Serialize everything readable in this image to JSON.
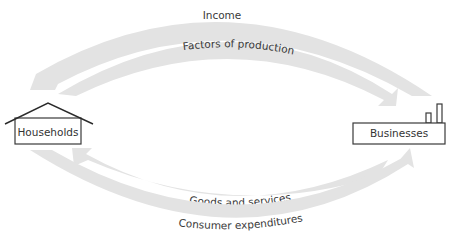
{
  "diagram": {
    "type": "circular-flow",
    "nodes": {
      "households": {
        "label": "Households"
      },
      "businesses": {
        "label": "Businesses"
      }
    },
    "flows": [
      {
        "id": "income",
        "label": "Income",
        "from": "businesses",
        "to": "households",
        "position": "top-outer"
      },
      {
        "id": "factors",
        "label": "Factors of production",
        "from": "households",
        "to": "businesses",
        "position": "top-inner"
      },
      {
        "id": "goods",
        "label": "Goods and services",
        "from": "businesses",
        "to": "households",
        "position": "bottom-inner"
      },
      {
        "id": "expenditures",
        "label": "Consumer expenditures",
        "from": "households",
        "to": "businesses",
        "position": "bottom-outer"
      }
    ],
    "colors": {
      "band": "#e3e3e3",
      "text": "#3a3a3a",
      "outline": "#2a2a2a"
    }
  }
}
